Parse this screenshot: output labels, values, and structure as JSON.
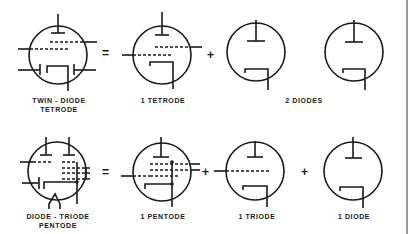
{
  "diagram": {
    "rows": [
      {
        "equation": "Twin-diode tetrode = 1 tetrode + 2 diodes",
        "composite": {
          "label_line1": "TWIN - DIODE",
          "label_line2": "TETRODE"
        },
        "operators": [
          "=",
          "+"
        ],
        "parts": [
          {
            "label": "1 TETRODE"
          },
          {
            "label": "2 DIODES"
          }
        ]
      },
      {
        "equation": "Diode-triode pentode = 1 pentode + 1 triode + 1 diode",
        "composite": {
          "label_line1": "DIODE - TRIODE",
          "label_line2": "PENTODE"
        },
        "operators": [
          "=",
          "+",
          "+"
        ],
        "parts": [
          {
            "label": "1 PENTODE"
          },
          {
            "label": "1 TRIODE"
          },
          {
            "label": "1 DIODE"
          }
        ]
      }
    ],
    "colors": {
      "ink": "#1a1a1a",
      "background": "#ffffff",
      "border": "#9a9a9a"
    }
  }
}
